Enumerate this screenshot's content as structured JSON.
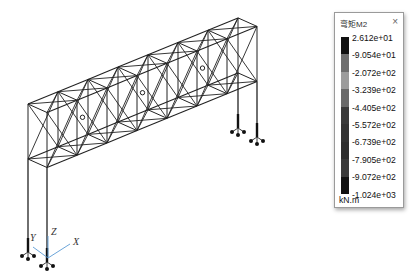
{
  "legend": {
    "title": "弯矩M2",
    "close_label": "×",
    "unit": "kN.m",
    "values": [
      "2.612e+01",
      "-9.054e+01",
      "-2.072e+02",
      "-3.239e+02",
      "-4.405e+02",
      "-5.572e+02",
      "-6.739e+02",
      "-7.905e+02",
      "-9.072e+02",
      "-1.024e+03"
    ],
    "band_colors": [
      "#111111",
      "#6e6e6e",
      "#9c9c9c",
      "#6a6a6a",
      "#3a3a3a",
      "#333333",
      "#2e2e2e",
      "#3a3a3a",
      "#111111"
    ]
  },
  "axes": {
    "x_label": "X",
    "y_label": "Y",
    "z_label": "Z",
    "axis_color": "#5b9bd5"
  },
  "model": {
    "line_color": "#222222",
    "bays": 7
  }
}
